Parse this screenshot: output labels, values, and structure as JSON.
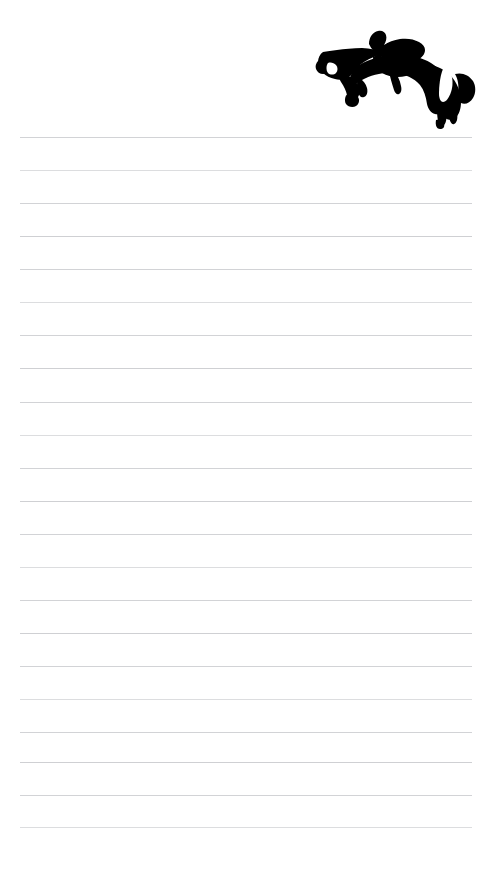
{
  "page": {
    "kind": "lined-notepaper",
    "width": 498,
    "height": 872,
    "background_color": "#ffffff",
    "title": "",
    "text_content": ""
  },
  "header": {
    "artwork": {
      "icon_name": "show-jumping-horse-and-rider-silhouette",
      "description": "Black silhouette of a horse and rider mid-jump",
      "color": "#000000",
      "marking_color": "#ffffff",
      "left": 315,
      "top": 14,
      "width": 162,
      "height": 116
    }
  },
  "ruling": {
    "line_color": "#d6d7d9",
    "line_thickness": 1,
    "left_margin": 20,
    "right_margin": 26,
    "line_width": 452,
    "first_line_y": 137,
    "line_spacing": 32.9,
    "line_count": 22,
    "lines": [
      {
        "index": 1,
        "y": 137,
        "tint": "tint-a"
      },
      {
        "index": 2,
        "y": 170,
        "tint": "tint-b"
      },
      {
        "index": 3,
        "y": 203,
        "tint": "tint-a"
      },
      {
        "index": 4,
        "y": 236,
        "tint": "tint-c"
      },
      {
        "index": 5,
        "y": 269,
        "tint": "tint-a"
      },
      {
        "index": 6,
        "y": 302,
        "tint": "tint-b"
      },
      {
        "index": 7,
        "y": 335,
        "tint": "tint-a"
      },
      {
        "index": 8,
        "y": 368,
        "tint": "tint-c"
      },
      {
        "index": 9,
        "y": 402,
        "tint": "tint-a"
      },
      {
        "index": 10,
        "y": 435,
        "tint": "tint-b"
      },
      {
        "index": 11,
        "y": 468,
        "tint": "tint-a"
      },
      {
        "index": 12,
        "y": 501,
        "tint": "tint-c"
      },
      {
        "index": 13,
        "y": 534,
        "tint": "tint-a"
      },
      {
        "index": 14,
        "y": 567,
        "tint": "tint-b"
      },
      {
        "index": 15,
        "y": 600,
        "tint": "tint-a"
      },
      {
        "index": 16,
        "y": 633,
        "tint": "tint-c"
      },
      {
        "index": 17,
        "y": 666,
        "tint": "tint-a"
      },
      {
        "index": 18,
        "y": 699,
        "tint": "tint-b"
      },
      {
        "index": 19,
        "y": 732,
        "tint": "tint-a"
      },
      {
        "index": 20,
        "y": 762,
        "tint": "tint-c"
      },
      {
        "index": 21,
        "y": 795,
        "tint": "tint-a"
      },
      {
        "index": 22,
        "y": 827,
        "tint": "tint-b"
      }
    ]
  }
}
